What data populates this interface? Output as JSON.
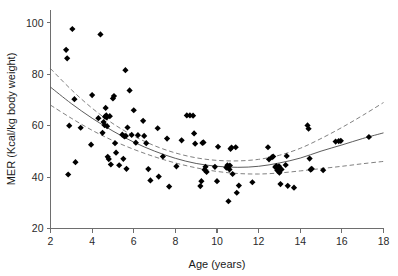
{
  "chart_data": {
    "type": "scatter",
    "title": "",
    "subtitle": "",
    "xlabel": "Age (years)",
    "ylabel": "MER (Kcal/kg body weight)",
    "xlim": [
      2,
      18
    ],
    "ylim": [
      20,
      105
    ],
    "xticks": [
      2,
      4,
      6,
      8,
      10,
      12,
      14,
      16,
      18
    ],
    "xtick_labels": [
      "2",
      "4",
      "6",
      "8",
      "10",
      "12",
      "14",
      "16",
      "18"
    ],
    "yticks": [
      20,
      40,
      60,
      80,
      100
    ],
    "ytick_labels": [
      "20",
      "40",
      "60",
      "80",
      "100"
    ],
    "grid": false,
    "legend": null,
    "annotations": [],
    "marker_style": "filled-diamond",
    "marker_color": "#000000",
    "series": [
      {
        "name": "MER observations",
        "marker": "diamond",
        "color": "#000000",
        "points": [
          [
            2.75,
            89.5
          ],
          [
            2.8,
            86.2
          ],
          [
            2.85,
            41.0
          ],
          [
            2.9,
            60.0
          ],
          [
            3.05,
            97.6
          ],
          [
            3.15,
            70.3
          ],
          [
            3.2,
            45.8
          ],
          [
            3.45,
            59.2
          ],
          [
            3.95,
            52.6
          ],
          [
            4.0,
            71.9
          ],
          [
            4.3,
            62.9
          ],
          [
            4.4,
            95.5
          ],
          [
            4.5,
            57.2
          ],
          [
            4.55,
            61.4
          ],
          [
            4.6,
            60.2
          ],
          [
            4.62,
            63.5
          ],
          [
            4.65,
            66.9
          ],
          [
            4.68,
            64.0
          ],
          [
            4.7,
            63.2
          ],
          [
            4.72,
            59.8
          ],
          [
            4.75,
            47.9
          ],
          [
            4.8,
            47.0
          ],
          [
            4.85,
            63.7
          ],
          [
            4.9,
            44.9
          ],
          [
            5.0,
            70.6
          ],
          [
            5.05,
            71.5
          ],
          [
            5.1,
            53.2
          ],
          [
            5.15,
            49.5
          ],
          [
            5.3,
            44.6
          ],
          [
            5.45,
            56.5
          ],
          [
            5.5,
            47.1
          ],
          [
            5.55,
            55.8
          ],
          [
            5.6,
            81.6
          ],
          [
            5.62,
            56.0
          ],
          [
            5.65,
            43.2
          ],
          [
            5.7,
            59.3
          ],
          [
            5.8,
            73.7
          ],
          [
            5.9,
            56.4
          ],
          [
            6.0,
            66.0
          ],
          [
            6.1,
            53.4
          ],
          [
            6.2,
            56.3
          ],
          [
            6.45,
            61.9
          ],
          [
            6.5,
            56.0
          ],
          [
            6.6,
            53.2
          ],
          [
            6.7,
            43.1
          ],
          [
            6.8,
            38.7
          ],
          [
            7.15,
            59.0
          ],
          [
            7.2,
            40.2
          ],
          [
            7.4,
            48.0
          ],
          [
            7.6,
            55.0
          ],
          [
            7.7,
            36.3
          ],
          [
            8.05,
            44.2
          ],
          [
            8.3,
            54.3
          ],
          [
            8.55,
            64.0
          ],
          [
            8.7,
            64.0
          ],
          [
            8.85,
            63.9
          ],
          [
            8.9,
            57.0
          ],
          [
            8.95,
            53.0
          ],
          [
            9.2,
            36.5
          ],
          [
            9.25,
            38.4
          ],
          [
            9.3,
            53.3
          ],
          [
            9.35,
            53.5
          ],
          [
            9.4,
            42.9
          ],
          [
            9.45,
            44.0
          ],
          [
            9.5,
            42.0
          ],
          [
            9.9,
            44.0
          ],
          [
            10.0,
            38.4
          ],
          [
            10.05,
            51.8
          ],
          [
            10.45,
            43.7
          ],
          [
            10.5,
            44.6
          ],
          [
            10.55,
            30.6
          ],
          [
            10.6,
            43.0
          ],
          [
            10.62,
            44.5
          ],
          [
            10.65,
            51.0
          ],
          [
            10.7,
            51.5
          ],
          [
            10.75,
            41.2
          ],
          [
            10.9,
            51.6
          ],
          [
            10.95,
            33.9
          ],
          [
            11.05,
            36.7
          ],
          [
            11.7,
            38.0
          ],
          [
            12.45,
            51.6
          ],
          [
            12.5,
            46.9
          ],
          [
            12.65,
            47.8
          ],
          [
            12.7,
            48.0
          ],
          [
            12.8,
            43.9
          ],
          [
            12.85,
            44.3
          ],
          [
            12.9,
            42.6
          ],
          [
            12.95,
            43.6
          ],
          [
            12.98,
            44.2
          ],
          [
            13.0,
            41.7
          ],
          [
            13.05,
            37.3
          ],
          [
            13.1,
            43.0
          ],
          [
            13.3,
            44.7
          ],
          [
            13.35,
            48.2
          ],
          [
            13.4,
            36.6
          ],
          [
            13.7,
            35.9
          ],
          [
            14.35,
            60.1
          ],
          [
            14.4,
            58.8
          ],
          [
            14.45,
            47.2
          ],
          [
            14.5,
            42.9
          ],
          [
            14.55,
            43.2
          ],
          [
            15.1,
            42.7
          ],
          [
            15.7,
            53.8
          ],
          [
            15.85,
            54.0
          ],
          [
            15.95,
            54.1
          ],
          [
            17.3,
            55.6
          ]
        ]
      }
    ],
    "fit_curve": {
      "name": "quadratic regression fit",
      "style": "solid",
      "color": "#4a4a4a",
      "points": [
        [
          2.0,
          75.0
        ],
        [
          3.0,
          68.6
        ],
        [
          4.0,
          62.9
        ],
        [
          5.0,
          57.9
        ],
        [
          6.0,
          53.6
        ],
        [
          7.0,
          50.1
        ],
        [
          8.0,
          47.3
        ],
        [
          9.0,
          45.3
        ],
        [
          10.0,
          44.2
        ],
        [
          11.0,
          43.8
        ],
        [
          12.0,
          44.2
        ],
        [
          13.0,
          45.5
        ],
        [
          14.0,
          47.4
        ],
        [
          15.0,
          50.1
        ],
        [
          16.0,
          52.5
        ],
        [
          17.0,
          55.0
        ],
        [
          18.0,
          57.2
        ]
      ]
    },
    "confidence_bands": [
      {
        "name": "upper 95% confidence band",
        "style": "dashed",
        "color": "#6a6a6a",
        "points": [
          [
            2.0,
            82.2
          ],
          [
            3.0,
            74.0
          ],
          [
            4.0,
            66.8
          ],
          [
            5.0,
            60.8
          ],
          [
            6.0,
            56.0
          ],
          [
            7.0,
            52.2
          ],
          [
            8.0,
            49.4
          ],
          [
            9.0,
            47.5
          ],
          [
            10.0,
            46.5
          ],
          [
            11.0,
            46.3
          ],
          [
            12.0,
            46.9
          ],
          [
            13.0,
            48.5
          ],
          [
            14.0,
            51.2
          ],
          [
            15.0,
            55.0
          ],
          [
            16.0,
            59.3
          ],
          [
            17.0,
            64.0
          ],
          [
            18.0,
            69.0
          ]
        ]
      },
      {
        "name": "lower 95% confidence band",
        "style": "dashed",
        "color": "#6a6a6a",
        "points": [
          [
            2.0,
            68.0
          ],
          [
            3.0,
            62.9
          ],
          [
            4.0,
            58.2
          ],
          [
            5.0,
            54.2
          ],
          [
            6.0,
            50.8
          ],
          [
            7.0,
            47.9
          ],
          [
            8.0,
            45.5
          ],
          [
            9.0,
            43.6
          ],
          [
            10.0,
            42.2
          ],
          [
            11.0,
            41.4
          ],
          [
            12.0,
            41.2
          ],
          [
            13.0,
            41.6
          ],
          [
            14.0,
            42.4
          ],
          [
            15.0,
            43.3
          ],
          [
            16.0,
            44.2
          ],
          [
            17.0,
            45.2
          ],
          [
            18.0,
            46.1
          ]
        ]
      }
    ]
  },
  "axes": {
    "x_title": "Age (years)",
    "y_title": "MER (Kcal/kg body weight)"
  }
}
